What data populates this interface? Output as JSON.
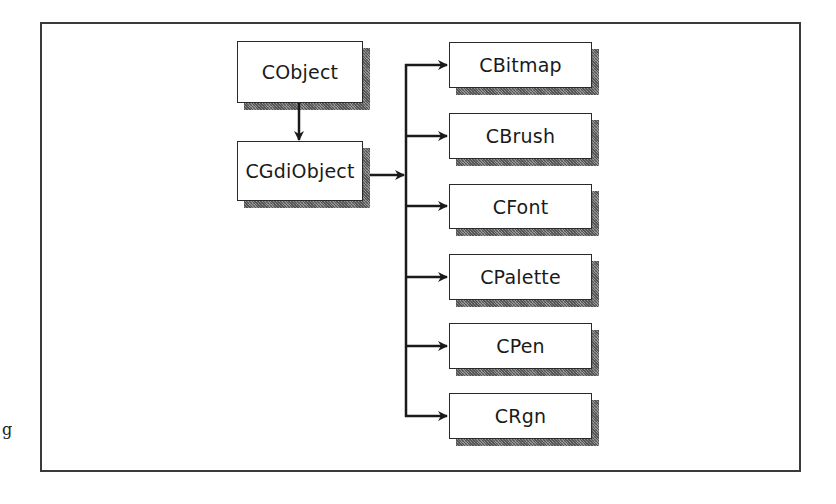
{
  "diagram": {
    "type": "class-hierarchy",
    "root": {
      "label": "CObject"
    },
    "parent": {
      "label": "CGdiObject"
    },
    "children": [
      {
        "label": "CBitmap"
      },
      {
        "label": "CBrush"
      },
      {
        "label": "CFont"
      },
      {
        "label": "CPalette"
      },
      {
        "label": "CPen"
      },
      {
        "label": "CRgn"
      }
    ],
    "edges": [
      {
        "from": "CObject",
        "to": "CGdiObject"
      },
      {
        "from": "CGdiObject",
        "to": "CBitmap"
      },
      {
        "from": "CGdiObject",
        "to": "CBrush"
      },
      {
        "from": "CGdiObject",
        "to": "CFont"
      },
      {
        "from": "CGdiObject",
        "to": "CPalette"
      },
      {
        "from": "CGdiObject",
        "to": "CPen"
      },
      {
        "from": "CGdiObject",
        "to": "CRgn"
      }
    ]
  },
  "margin_text": "g",
  "colors": {
    "line": "#1a1a1a",
    "box_border": "#2a2a2a",
    "shadow": "#7a7a7a",
    "background": "#ffffff"
  }
}
